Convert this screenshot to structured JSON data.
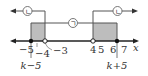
{
  "diagram": {
    "type": "number-line",
    "axis_label": "x",
    "ticks": [
      {
        "label": "-5",
        "value": -5
      },
      {
        "label": "-4",
        "value": -4
      },
      {
        "label": "-3",
        "value": -3
      },
      {
        "label": "4",
        "value": 4
      },
      {
        "label": "5",
        "value": 5
      },
      {
        "label": "6",
        "value": 6
      },
      {
        "label": "7",
        "value": 7
      }
    ],
    "points": [
      {
        "name": "k-5",
        "label": "k−5",
        "filled": true
      },
      {
        "name": "-3",
        "filled": false
      },
      {
        "name": "4",
        "filled": false
      },
      {
        "name": "k+5",
        "label": "k+5",
        "filled": true
      }
    ],
    "ranges": {
      "g": {
        "label": "ㄱ",
        "desc": "k−5 ≤ x ≤ k+5"
      },
      "n_left": {
        "label": "ㄴ",
        "desc": "x < -3"
      },
      "n_right": {
        "label": "ㄴ",
        "desc": "x > 4"
      }
    },
    "labels": {
      "k_minus_5": "k−5",
      "k_plus_5": "k+5",
      "m5": "−5",
      "m4": "−4",
      "m3": "−3",
      "p4": "4",
      "p5": "5",
      "p6": "6",
      "p7": "7",
      "x": "x",
      "circle_g": "ㄱ",
      "circle_n": "ㄴ"
    },
    "colors": {
      "line": "#333333",
      "shade": "#bdbdbd"
    }
  }
}
